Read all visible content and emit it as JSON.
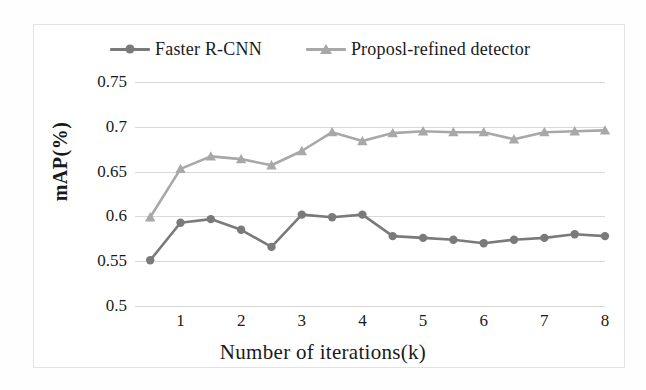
{
  "chart_data": {
    "type": "line",
    "title": "",
    "xlabel": "Number of iterations(k)",
    "ylabel": "mAP(%)",
    "xlim": [
      0.25,
      8.0
    ],
    "ylim": [
      0.5,
      0.75
    ],
    "xticks": [
      "1",
      "2",
      "3",
      "4",
      "5",
      "6",
      "7",
      "8"
    ],
    "xtick_values": [
      1,
      2,
      3,
      4,
      5,
      6,
      7,
      8
    ],
    "yticks": [
      "0.5",
      "0.55",
      "0.6",
      "0.65",
      "0.7",
      "0.75"
    ],
    "ytick_values": [
      0.5,
      0.55,
      0.6,
      0.65,
      0.7,
      0.75
    ],
    "grid": "horizontal",
    "legend_position": "top",
    "x": [
      0.5,
      1.0,
      1.5,
      2.0,
      2.5,
      3.0,
      3.5,
      4.0,
      4.5,
      5.0,
      5.5,
      6.0,
      6.5,
      7.0,
      7.5,
      8.0
    ],
    "series": [
      {
        "name": "Faster R-CNN",
        "marker": "circle",
        "color": "#7a7a7a",
        "values": [
          0.551,
          0.593,
          0.597,
          0.585,
          0.566,
          0.602,
          0.599,
          0.602,
          0.578,
          0.576,
          0.574,
          0.57,
          0.574,
          0.576,
          0.58,
          0.578
        ]
      },
      {
        "name": "Proposl-refined detector",
        "marker": "triangle",
        "color": "#a8a8a8",
        "values": [
          0.599,
          0.653,
          0.667,
          0.664,
          0.657,
          0.673,
          0.694,
          0.684,
          0.693,
          0.695,
          0.694,
          0.694,
          0.686,
          0.694,
          0.695,
          0.696
        ]
      }
    ]
  },
  "legend": {
    "entries": [
      {
        "label": "Faster R-CNN",
        "marker": "circle-marker",
        "color": "#7a7a7a"
      },
      {
        "label": "Proposl-refined detector",
        "marker": "triangle-marker",
        "color": "#a8a8a8"
      }
    ]
  },
  "axes": {
    "y_title": "mAP(%)",
    "x_title": "Number of iterations(k)"
  },
  "colors": {
    "series1": "#7a7a7a",
    "series2": "#a8a8a8",
    "gridline": "#d9d9d9",
    "frame": "#e3e3e3",
    "text": "#1a1a1a"
  }
}
